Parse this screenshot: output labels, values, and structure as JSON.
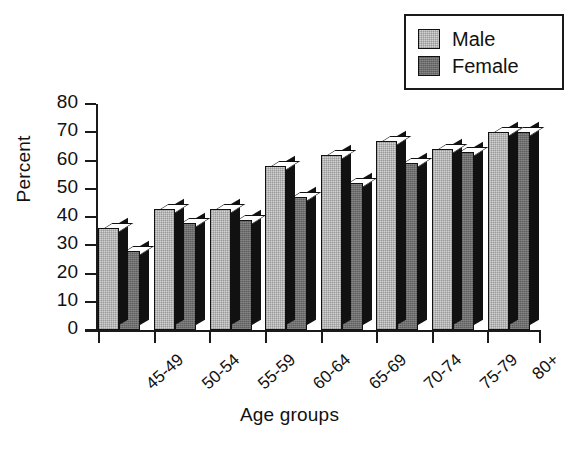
{
  "chart_data": {
    "type": "bar",
    "title": "",
    "subtitle": "",
    "xlabel": "Age groups",
    "ylabel": "Percent",
    "categories": [
      "45-49",
      "50-54",
      "55-59",
      "60-64",
      "65-69",
      "70-74",
      "75-79",
      "80+"
    ],
    "series": [
      {
        "name": "Male",
        "color": "#d2d2d2",
        "values": [
          36,
          43,
          43,
          58,
          62,
          67,
          64,
          70
        ]
      },
      {
        "name": "Female",
        "color": "#6e6e6e",
        "values": [
          28,
          38,
          39,
          47,
          52,
          59,
          63,
          70
        ]
      }
    ],
    "ylim": [
      0,
      80
    ],
    "ytick_labels": [
      "80",
      "70",
      "60",
      "50",
      "40",
      "30",
      "20",
      "10",
      "0"
    ],
    "ytick_values": [
      80,
      70,
      60,
      50,
      40,
      30,
      20,
      10,
      0
    ],
    "ytick_step": 10,
    "grid": false,
    "legend_position": "top-right",
    "style": "3d-grouped-bars",
    "xtick_label_rotation": -42
  },
  "legend": {
    "items": [
      {
        "label": "Male"
      },
      {
        "label": "Female"
      }
    ]
  }
}
